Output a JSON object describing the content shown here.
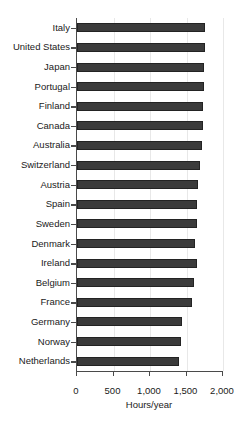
{
  "chart_data": {
    "type": "bar",
    "orientation": "horizontal",
    "title": "",
    "xlabel": "Hours/year",
    "ylabel": "",
    "xlim": [
      0,
      2000
    ],
    "xticks": [
      0,
      500,
      1000,
      1500,
      2000
    ],
    "xtick_labels": [
      "0",
      "500",
      "1,000",
      "1,500",
      "2,000"
    ],
    "grid": true,
    "grid_axis": "x",
    "legend": false,
    "bar_color": "#3b3b3b",
    "bar_edge_color": "#232323",
    "axis_color": "#4a4a4a",
    "categories": [
      "Italy",
      "United States",
      "Japan",
      "Portugal",
      "Finland",
      "Canada",
      "Australia",
      "Switzerland",
      "Austria",
      "Spain",
      "Sweden",
      "Denmark",
      "Ireland",
      "Belgium",
      "France",
      "Germany",
      "Norway",
      "Netherlands"
    ],
    "values": [
      1760,
      1760,
      1740,
      1740,
      1730,
      1720,
      1710,
      1680,
      1660,
      1650,
      1645,
      1620,
      1640,
      1600,
      1580,
      1440,
      1430,
      1400
    ]
  },
  "figure": {
    "caption_partial": ""
  }
}
